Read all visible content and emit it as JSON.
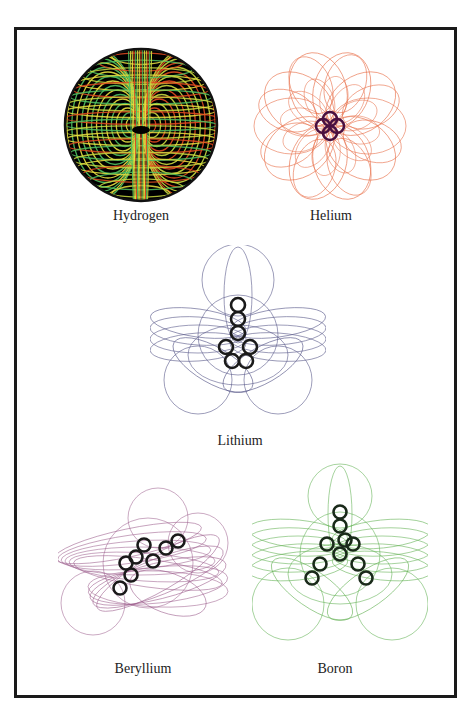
{
  "figure": {
    "panels": [
      {
        "id": "hydrogen",
        "label": "Hydrogen",
        "style": "filled-sphere",
        "background": "#000000",
        "line_colors": [
          "#e8e040",
          "#e04a20",
          "#50c060",
          "#c8d840"
        ],
        "nucleus_color": "#000000"
      },
      {
        "id": "helium",
        "label": "Helium",
        "style": "rosette",
        "line_color": "#e8704a",
        "nucleus_color": "#4a1040",
        "nucleus_rings": 4
      },
      {
        "id": "lithium",
        "label": "Lithium",
        "style": "rosette",
        "line_color": "#5a5a8a",
        "nucleus_color": "#1a1a1a",
        "nucleus_rings": 7
      },
      {
        "id": "beryllium",
        "label": "Beryllium",
        "style": "rosette",
        "line_color": "#9a5a8a",
        "nucleus_color": "#1a1a1a",
        "nucleus_rings": 8
      },
      {
        "id": "boron",
        "label": "Boron",
        "style": "rosette",
        "line_color": "#60b050",
        "nucleus_color": "#1a2a1a",
        "nucleus_rings": 10
      }
    ]
  }
}
